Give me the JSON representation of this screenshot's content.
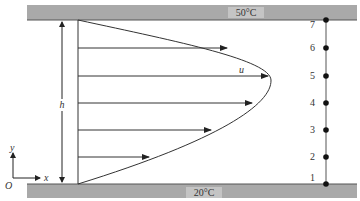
{
  "diagram": {
    "top_plate": {
      "temperature_label": "50°C",
      "color": "#a9a9a9"
    },
    "bottom_plate": {
      "temperature_label": "20°C",
      "color": "#a9a9a9"
    },
    "gap_label": "h",
    "velocity_label": "u",
    "axes": {
      "origin_label": "O",
      "x_label": "x",
      "y_label": "y"
    },
    "nodes": [
      {
        "label": "1"
      },
      {
        "label": "2"
      },
      {
        "label": "3"
      },
      {
        "label": "4"
      },
      {
        "label": "5"
      },
      {
        "label": "6"
      },
      {
        "label": "7"
      }
    ],
    "line_color": "#222222"
  }
}
